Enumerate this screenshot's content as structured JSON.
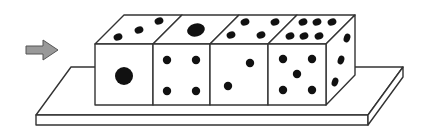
{
  "diagram": {
    "colors": {
      "background": "#ffffff",
      "line": "#333333",
      "pip": "#111111",
      "arrow_fill": "#999999",
      "arrow_stroke": "#555555",
      "face": "#ffffff"
    },
    "arrow": {
      "direction": "right",
      "points_to": "die-1-front-face"
    },
    "dice": [
      {
        "index": 1,
        "front_pips": 1,
        "top_pips": 3
      },
      {
        "index": 2,
        "front_pips": 4,
        "top_pips": 1
      },
      {
        "index": 3,
        "front_pips": 2,
        "top_pips": 4
      },
      {
        "index": 4,
        "front_pips": 5,
        "top_pips": 6,
        "right_pips": 3
      }
    ]
  }
}
